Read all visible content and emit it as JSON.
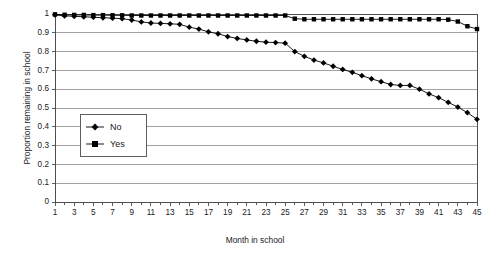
{
  "chart_data": {
    "type": "line",
    "title": "",
    "xlabel": "Month in school",
    "ylabel": "Proportion remaining in school",
    "xlim": [
      1,
      45
    ],
    "ylim": [
      0,
      1
    ],
    "grid": true,
    "legend_position": "inside-left",
    "x": [
      1,
      2,
      3,
      4,
      5,
      6,
      7,
      8,
      9,
      10,
      11,
      12,
      13,
      14,
      15,
      16,
      17,
      18,
      19,
      20,
      21,
      22,
      23,
      24,
      25,
      26,
      27,
      28,
      29,
      30,
      31,
      32,
      33,
      34,
      35,
      36,
      37,
      38,
      39,
      40,
      41,
      42,
      43,
      44,
      45
    ],
    "yticks": [
      "0",
      "0.1",
      "0.2",
      "0.3",
      "0.4",
      "0.5",
      "0.6",
      "0.7",
      "0.8",
      "0.9",
      "1"
    ],
    "ytick_values": [
      0,
      0.1,
      0.2,
      0.3,
      0.4,
      0.5,
      0.6,
      0.7,
      0.8,
      0.9,
      1
    ],
    "xticks": [
      "1",
      "3",
      "5",
      "7",
      "9",
      "11",
      "13",
      "15",
      "17",
      "19",
      "21",
      "23",
      "25",
      "27",
      "29",
      "31",
      "33",
      "35",
      "37",
      "39",
      "41",
      "43",
      "45"
    ],
    "xtick_values": [
      1,
      3,
      5,
      7,
      9,
      11,
      13,
      15,
      17,
      19,
      21,
      23,
      25,
      27,
      29,
      31,
      33,
      35,
      37,
      39,
      41,
      43,
      45
    ],
    "series": [
      {
        "name": "No",
        "marker": "diamond",
        "values": [
          0.995,
          0.99,
          0.988,
          0.985,
          0.983,
          0.98,
          0.978,
          0.975,
          0.972,
          0.968,
          0.963,
          0.96,
          0.958,
          0.956,
          0.953,
          0.95,
          0.948,
          0.947,
          0.946,
          0.945,
          0.944,
          0.943,
          0.942,
          0.941,
          0.94,
          0.925,
          0.905,
          0.89,
          0.878,
          0.866,
          0.855,
          0.845,
          0.835,
          0.825,
          0.812,
          0.8,
          0.79,
          0.782,
          0.775,
          0.768,
          0.76,
          0.75,
          0.74,
          0.732,
          0.725
        ]
      },
      {
        "name": "Yes",
        "marker": "square",
        "values": [
          0.998,
          0.996,
          0.995,
          0.995,
          0.994,
          0.994,
          0.993,
          0.993,
          0.992,
          0.992,
          0.992,
          0.992,
          0.992,
          0.992,
          0.992,
          0.992,
          0.992,
          0.992,
          0.992,
          0.992,
          0.992,
          0.992,
          0.992,
          0.992,
          0.992,
          0.975,
          0.972,
          0.972,
          0.972,
          0.972,
          0.972,
          0.972,
          0.972,
          0.972,
          0.972,
          0.972,
          0.972,
          0.972,
          0.972,
          0.972,
          0.972,
          0.972,
          0.96,
          0.935,
          0.92
        ]
      }
    ],
    "series_full": {
      "No": [
        0.995,
        0.99,
        0.988,
        0.985,
        0.983,
        0.98,
        0.978,
        0.975,
        0.968,
        0.958,
        0.952,
        0.95,
        0.948,
        0.945,
        0.93,
        0.92,
        0.905,
        0.895,
        0.88,
        0.87,
        0.862,
        0.855,
        0.85,
        0.848,
        0.845,
        0.8,
        0.775,
        0.755,
        0.74,
        0.722,
        0.705,
        0.69,
        0.672,
        0.655,
        0.64,
        0.625,
        0.62,
        0.62,
        0.6,
        0.575,
        0.555,
        0.53,
        0.505,
        0.475,
        0.44
      ],
      "Yes": [
        0.998,
        0.996,
        0.995,
        0.995,
        0.994,
        0.994,
        0.993,
        0.993,
        0.992,
        0.992,
        0.992,
        0.992,
        0.992,
        0.992,
        0.992,
        0.992,
        0.992,
        0.992,
        0.992,
        0.992,
        0.992,
        0.992,
        0.992,
        0.992,
        0.992,
        0.975,
        0.972,
        0.972,
        0.972,
        0.972,
        0.972,
        0.972,
        0.972,
        0.972,
        0.972,
        0.972,
        0.972,
        0.972,
        0.972,
        0.972,
        0.972,
        0.97,
        0.96,
        0.935,
        0.92
      ]
    }
  },
  "legend": {
    "items": [
      {
        "label": "No",
        "marker": "diamond"
      },
      {
        "label": "Yes",
        "marker": "square"
      }
    ]
  },
  "axes": {
    "y_title": "Proportion remaining in school",
    "x_title": "Month in school"
  },
  "colors": {
    "series": "#000000",
    "grid": "#8c8c8c",
    "axis": "#4d4d4d",
    "background": "#ffffff"
  }
}
